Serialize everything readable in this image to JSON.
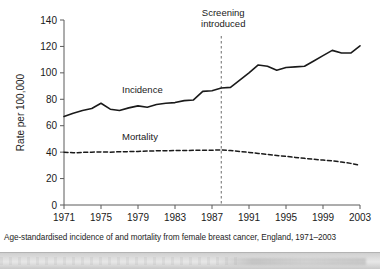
{
  "figure": {
    "caption": "Age-standardised incidence of and mortality from female breast cancer, England, 1971–2003",
    "y_axis_title": "Rate per 100,000",
    "annotation_line1": "Screening",
    "annotation_line2": "introduced",
    "annotation_year": 1988,
    "incidence_label": "Incidence",
    "mortality_label": "Mortality",
    "colors": {
      "line": "#1a1a1a",
      "axis": "#5a5a5a",
      "background": "#ffffff",
      "text": "#1a1a1a"
    }
  },
  "chart_data": {
    "type": "line",
    "title": "",
    "subtitle": "",
    "xlabel": "",
    "ylabel": "Rate per 100,000",
    "xlim": [
      1971,
      2003
    ],
    "ylim": [
      0,
      140
    ],
    "yticks": [
      0,
      20,
      40,
      60,
      80,
      100,
      120,
      140
    ],
    "xticks": [
      1971,
      1975,
      1979,
      1983,
      1987,
      1991,
      1995,
      1999,
      2003
    ],
    "ytick_labels": [
      "0",
      "20",
      "40",
      "60",
      "80",
      "100",
      "120",
      "140"
    ],
    "xtick_labels": [
      "1971",
      "1975",
      "1979",
      "1983",
      "1987",
      "1991",
      "1995",
      "1999",
      "2003"
    ],
    "grid": false,
    "legend": "inline-labels",
    "x": [
      1971,
      1972,
      1973,
      1974,
      1975,
      1976,
      1977,
      1978,
      1979,
      1980,
      1981,
      1982,
      1983,
      1984,
      1985,
      1986,
      1987,
      1988,
      1989,
      1990,
      1991,
      1992,
      1993,
      1994,
      1995,
      1996,
      1997,
      1998,
      1999,
      2000,
      2001,
      2002,
      2003
    ],
    "series": [
      {
        "name": "Incidence",
        "style": "solid",
        "values": [
          67.0,
          69.5,
          71.5,
          73.0,
          77.0,
          72.5,
          71.5,
          73.5,
          75.0,
          74.0,
          76.0,
          77.0,
          77.5,
          79.0,
          79.5,
          86.0,
          86.5,
          88.5,
          89.0,
          94.5,
          100.0,
          106.0,
          105.0,
          102.0,
          104.0,
          104.5,
          105.0,
          109.0,
          113.0,
          117.0,
          115.0,
          115.0,
          120.5
        ]
      },
      {
        "name": "Mortality",
        "style": "dashed",
        "values": [
          40.0,
          39.5,
          39.8,
          40.0,
          40.2,
          40.0,
          40.3,
          40.4,
          40.5,
          40.8,
          41.0,
          41.0,
          41.2,
          41.2,
          41.4,
          41.5,
          41.5,
          41.6,
          41.2,
          40.5,
          39.8,
          39.0,
          38.2,
          37.5,
          36.8,
          36.0,
          35.3,
          34.6,
          34.0,
          33.4,
          32.5,
          31.5,
          30.0
        ]
      }
    ],
    "annotations": [
      {
        "text": "Screening introduced",
        "x": 1988,
        "type": "vertical-dashed-line"
      }
    ]
  }
}
